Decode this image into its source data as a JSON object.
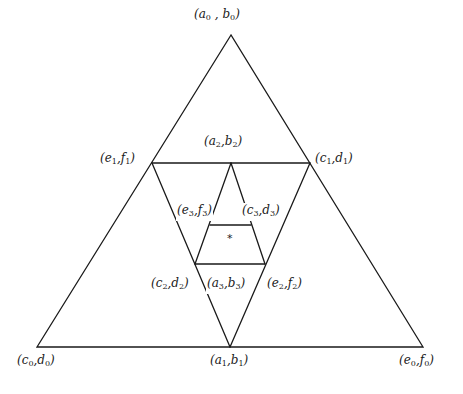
{
  "diagram": {
    "stroke_color": "#1a1a1a",
    "background": "#ffffff",
    "labels": [
      {
        "id": "a0b0",
        "p": "a",
        "q": "b",
        "i": "0",
        "x": 193,
        "y": 7,
        "sep": " , "
      },
      {
        "id": "a2b2",
        "p": "a",
        "q": "b",
        "i": "2",
        "x": 203,
        "y": 134,
        "sep": ","
      },
      {
        "id": "e1f1",
        "p": "e",
        "q": "f",
        "i": "1",
        "x": 99,
        "y": 151,
        "sep": ","
      },
      {
        "id": "c1d1",
        "p": "c",
        "q": "d",
        "i": "1",
        "x": 314,
        "y": 151,
        "sep": ","
      },
      {
        "id": "e3f3",
        "p": "e",
        "q": "f",
        "i": "3",
        "x": 176,
        "y": 203,
        "sep": ","
      },
      {
        "id": "c3d3",
        "p": "c",
        "q": "d",
        "i": "3",
        "x": 241,
        "y": 203,
        "sep": ","
      },
      {
        "id": "c2d2",
        "p": "c",
        "q": "d",
        "i": "2",
        "x": 150,
        "y": 276,
        "sep": ","
      },
      {
        "id": "a3b3",
        "p": "a",
        "q": "b",
        "i": "3",
        "x": 206,
        "y": 276,
        "sep": ","
      },
      {
        "id": "e2f2",
        "p": "e",
        "q": "f",
        "i": "2",
        "x": 266,
        "y": 276,
        "sep": ","
      },
      {
        "id": "c0d0",
        "p": "c",
        "q": "d",
        "i": "0",
        "x": 16,
        "y": 353,
        "sep": ","
      },
      {
        "id": "a1b1",
        "p": "a",
        "q": "b",
        "i": "1",
        "x": 209,
        "y": 353,
        "sep": ","
      },
      {
        "id": "e0f0",
        "p": "e",
        "q": "f",
        "i": "0",
        "x": 398,
        "y": 353,
        "sep": ","
      }
    ],
    "center_mark": "*"
  }
}
